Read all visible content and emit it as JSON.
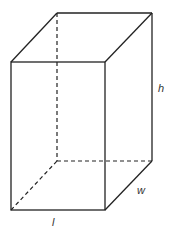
{
  "diagram": {
    "labels": {
      "height": "h",
      "width": "w",
      "length": "l"
    },
    "colors": {
      "line": "#222222",
      "label": "#333333",
      "background": "#ffffff"
    }
  }
}
